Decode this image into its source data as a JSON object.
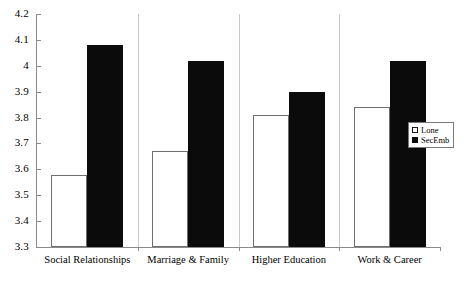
{
  "chart_data": {
    "type": "bar",
    "title": "",
    "subtitle": "",
    "xlabel": "",
    "ylabel": "",
    "ylim": [
      3.3,
      4.2
    ],
    "ytick_step": 0.1,
    "yticks": [
      "4.2",
      "4.1",
      "4",
      "3.9",
      "3.8",
      "3.7",
      "3.6",
      "3.5",
      "3.4",
      "3.3"
    ],
    "ytick_values": [
      4.2,
      4.1,
      4.0,
      3.9,
      3.8,
      3.7,
      3.6,
      3.5,
      3.4,
      3.3
    ],
    "grid": false,
    "legend_position": "right-inside",
    "categories": [
      "Social Relationships",
      "Marriage & Family",
      "Higher Education",
      "Work & Career"
    ],
    "series": [
      {
        "name": "Lone",
        "color": "#ffffff",
        "edge_color": "#6e6e6e",
        "values": [
          3.58,
          3.67,
          3.81,
          3.84
        ]
      },
      {
        "name": "SecEmb",
        "color": "#0b0b0b",
        "edge_color": "#0b0b0b",
        "values": [
          4.08,
          4.02,
          3.9,
          4.02
        ]
      }
    ]
  },
  "legend": {
    "items": [
      {
        "label": "Lone"
      },
      {
        "label": "SecEmb"
      }
    ]
  },
  "colors": {
    "axis": "#8a8a8a",
    "separator": "#c9c9c9",
    "background": "#ffffff",
    "text": "#000000"
  }
}
